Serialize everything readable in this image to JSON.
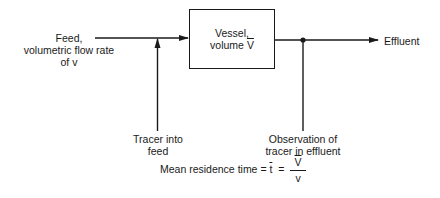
{
  "diagram": {
    "type": "flow-diagram",
    "vessel": {
      "line1": "Vessel,",
      "line2_prefix": "volume ",
      "line2_symbol": "V"
    },
    "feed": {
      "line1": "Feed,",
      "line2": "volumetric flow rate",
      "line3": "of v"
    },
    "tracer_input": {
      "line1": "Tracer into",
      "line2": "feed"
    },
    "observation": {
      "line1": "Observation of",
      "line2": "tracer in effluent"
    },
    "effluent": "Effluent",
    "formula": {
      "label": "Mean residence time = ",
      "symbol": "t",
      "equals": "=",
      "numerator": "V",
      "denominator": "v"
    },
    "colors": {
      "line": "#1a1a1a",
      "background": "#ffffff"
    }
  }
}
